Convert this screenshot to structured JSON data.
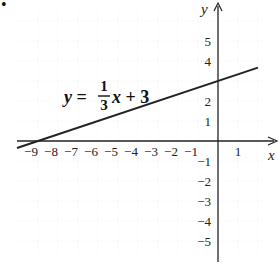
{
  "chart_data": {
    "type": "line",
    "title": "",
    "xlabel": "x",
    "ylabel": "y",
    "equation": {
      "lhs": "y =",
      "numerator": "1",
      "denominator": "3",
      "rest_var": "x",
      "rest": "+ 3"
    },
    "series": [
      {
        "name": "y = (1/3)x + 3",
        "slope": 0.3333,
        "intercept": 3,
        "x": [
          -10,
          -9,
          0,
          2
        ],
        "y": [
          -0.33,
          0,
          3,
          3.67
        ]
      }
    ],
    "x_ticks": [
      "-9",
      "-8",
      "-7",
      "-6",
      "-5",
      "-4",
      "-3",
      "-2",
      "-1",
      "1"
    ],
    "x_tick_values": [
      -9,
      -8,
      -7,
      -6,
      -5,
      -4,
      -3,
      -2,
      -1,
      1
    ],
    "y_ticks": [
      "5",
      "4",
      "2",
      "1",
      "-1",
      "-2",
      "-3",
      "-4",
      "-5"
    ],
    "y_tick_values": [
      5,
      4,
      2,
      1,
      -1,
      -2,
      -3,
      -4,
      -5
    ],
    "xlim": [
      -10,
      3
    ],
    "ylim": [
      -6,
      7
    ],
    "grid": true,
    "legend": "none",
    "colors": {
      "line": "#222222",
      "axis": "#222222",
      "grid": "#e4e4e4"
    }
  },
  "marker": "•"
}
